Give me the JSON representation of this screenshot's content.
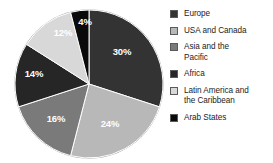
{
  "chart_data": {
    "type": "pie",
    "title": "",
    "subtitle": "",
    "xlabel": "",
    "ylabel": "",
    "grid": false,
    "legend_position": "right",
    "units": "percent",
    "start_angle_deg": 0,
    "direction": "clockwise",
    "categories": [
      "Europe",
      "USA and Canada",
      "Asia and the Pacific",
      "Africa",
      "Latin America and the Caribbean",
      "Arab States"
    ],
    "values": [
      30,
      24,
      16,
      14,
      12,
      4
    ],
    "data_labels": [
      "30%",
      "24%",
      "16%",
      "14%",
      "12%",
      "4%"
    ],
    "colors": [
      "#333333",
      "#b8b8b8",
      "#7a7a7a",
      "#262626",
      "#d8d8d8",
      "#0a0a0a"
    ],
    "slices": [
      {
        "label": "Europe",
        "value": 30,
        "data_label": "30%",
        "color": "#333333",
        "label_x": 122,
        "label_y": 52
      },
      {
        "label": "USA and Canada",
        "value": 24,
        "data_label": "24%",
        "color": "#b8b8b8",
        "label_x": 110,
        "label_y": 124
      },
      {
        "label": "Asia and the Pacific",
        "value": 16,
        "data_label": "16%",
        "color": "#7a7a7a",
        "label_x": 56,
        "label_y": 119
      },
      {
        "label": "Africa",
        "value": 14,
        "data_label": "14%",
        "color": "#262626",
        "label_x": 34,
        "label_y": 74
      },
      {
        "label": "Latin America and the Caribbean",
        "value": 12,
        "data_label": "12%",
        "color": "#d8d8d8",
        "label_x": 63,
        "label_y": 33
      },
      {
        "label": "Arab States",
        "value": 4,
        "data_label": "4%",
        "color": "#0a0a0a",
        "label_x": 85,
        "label_y": 22
      }
    ]
  },
  "legend": {
    "items": [
      {
        "label": "Europe",
        "color": "#333333"
      },
      {
        "label": "USA and Canada",
        "color": "#b8b8b8"
      },
      {
        "label": "Asia and the\nPacific",
        "color": "#7a7a7a"
      },
      {
        "label": "Africa",
        "color": "#262626"
      },
      {
        "label": "Latin America and\nthe Caribbean",
        "color": "#d8d8d8"
      },
      {
        "label": "Arab States",
        "color": "#0a0a0a"
      }
    ]
  },
  "geometry": {
    "center_x": 89,
    "center_y": 84,
    "radius": 74
  },
  "style": {
    "background": "#ffffff",
    "slice_border": "#ffffff",
    "label_color": "#ffffff"
  }
}
